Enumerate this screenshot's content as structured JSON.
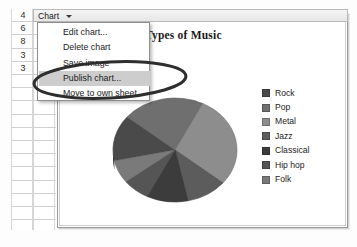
{
  "app": {
    "menubar": {
      "menu_label": "Chart",
      "caret_icon": "chevron-down-icon"
    },
    "menu": {
      "items": [
        {
          "label": "Edit chart...",
          "highlighted": false
        },
        {
          "label": "Delete chart",
          "highlighted": false
        },
        {
          "label": "Save image",
          "highlighted": false
        },
        {
          "label": "Publish chart...",
          "highlighted": true
        },
        {
          "label": "Move to own sheet...",
          "highlighted": false
        }
      ]
    }
  },
  "spreadsheet": {
    "column_values": [
      "4",
      "6",
      "8",
      "3",
      "3"
    ],
    "blank_rows": 11
  },
  "annotation": {
    "shape": "hand-drawn-ellipse",
    "targets_menu_item": "Publish chart...",
    "color": "#2e2e2e"
  },
  "chart_data": {
    "type": "pie",
    "title": "Types of Music",
    "categories": [
      "Rock",
      "Pop",
      "Metal",
      "Jazz",
      "Classical",
      "Hip hop",
      "Folk"
    ],
    "values": [
      4,
      6,
      8,
      3,
      3,
      2,
      2
    ],
    "colors": [
      "#4a4a4a",
      "#6f6f6f",
      "#8d8d8d",
      "#5c5c5c",
      "#3c3c3c",
      "#555555",
      "#7a7a7a"
    ],
    "legend_position": "right",
    "grid": false,
    "xlabel": "",
    "ylabel": ""
  }
}
